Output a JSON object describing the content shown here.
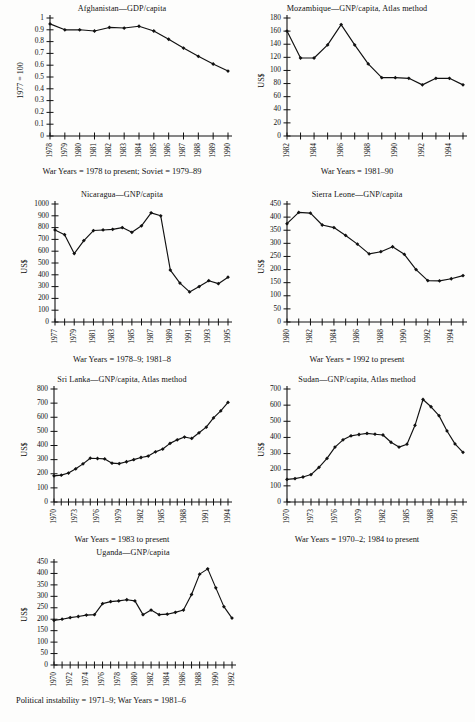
{
  "page": {
    "background_color": "#fdfdfc",
    "ink_color": "#111111",
    "footer_bleed": ""
  },
  "chart_data": [
    {
      "id": "afghanistan",
      "type": "line",
      "title": "Afghanistan—GDP/capita",
      "ylabel": "1977 = 100",
      "xlabel": "",
      "caption": "War Years = 1978 to present; Soviet = 1979–89",
      "ylim": [
        0,
        1
      ],
      "yticks": [
        "0",
        "0.1",
        "0.2",
        "0.3",
        "0.4",
        "0.5",
        "0.6",
        "0.7",
        "0.8",
        "0.9",
        "1"
      ],
      "ytickvals": [
        0,
        0.1,
        0.2,
        0.3,
        0.4,
        0.5,
        0.6,
        0.7,
        0.8,
        0.9,
        1
      ],
      "x": [
        1978,
        1979,
        1980,
        1981,
        1982,
        1983,
        1984,
        1985,
        1986,
        1987,
        1988,
        1989,
        1990
      ],
      "xtick_labels": [
        "1978",
        "1979",
        "1980",
        "1981",
        "1982",
        "1983",
        "1984",
        "1985",
        "1986",
        "1987",
        "1988",
        "1989",
        "1990"
      ],
      "values": [
        0.95,
        0.9,
        0.9,
        0.89,
        0.92,
        0.915,
        0.93,
        0.89,
        0.82,
        0.745,
        0.675,
        0.61,
        0.55
      ],
      "grid": false,
      "legend": "none"
    },
    {
      "id": "mozambique",
      "type": "line",
      "title": "Mozambique—GNP/capita, Atlas method",
      "ylabel": "US$",
      "xlabel": "",
      "caption": "War Years = 1981–90",
      "ylim": [
        0,
        180
      ],
      "yticks": [
        "0",
        "20",
        "40",
        "60",
        "80",
        "100",
        "120",
        "140",
        "160",
        "180"
      ],
      "ytickvals": [
        0,
        20,
        40,
        60,
        80,
        100,
        120,
        140,
        160,
        180
      ],
      "x": [
        1982,
        1983,
        1984,
        1985,
        1986,
        1987,
        1988,
        1989,
        1990,
        1991,
        1992,
        1993,
        1994,
        1995
      ],
      "xtick_labels": [
        "1982",
        "",
        "1984",
        "",
        "1986",
        "",
        "1988",
        "",
        "1990",
        "",
        "1992",
        "",
        "1994",
        ""
      ],
      "values": [
        160,
        119,
        119,
        139,
        170,
        139,
        110,
        89,
        89,
        88,
        78,
        88,
        88,
        78
      ],
      "grid": false,
      "legend": "none"
    },
    {
      "id": "nicaragua",
      "type": "line",
      "title": "Nicaragua—GNP/capita",
      "ylabel": "US$",
      "xlabel": "",
      "caption": "War Years = 1978–9; 1981–8",
      "ylim": [
        0,
        1000
      ],
      "yticks": [
        "0",
        "100",
        "200",
        "300",
        "400",
        "500",
        "600",
        "700",
        "800",
        "900",
        "1000"
      ],
      "ytickvals": [
        0,
        100,
        200,
        300,
        400,
        500,
        600,
        700,
        800,
        900,
        1000
      ],
      "x": [
        1977,
        1978,
        1979,
        1980,
        1981,
        1982,
        1983,
        1984,
        1985,
        1986,
        1987,
        1988,
        1989,
        1990,
        1991,
        1992,
        1993,
        1994,
        1995
      ],
      "xtick_labels": [
        "1977",
        "",
        "1979",
        "",
        "1981",
        "",
        "1983",
        "",
        "1985",
        "",
        "1987",
        "",
        "1989",
        "",
        "1991",
        "",
        "1993",
        "",
        "1995"
      ],
      "values": [
        780,
        740,
        580,
        690,
        775,
        780,
        785,
        800,
        760,
        815,
        925,
        900,
        440,
        330,
        255,
        300,
        350,
        325,
        380
      ],
      "grid": false,
      "legend": "none"
    },
    {
      "id": "sierra-leone",
      "type": "line",
      "title": "Sierra Leone—GNP/capita",
      "ylabel": "US$",
      "xlabel": "",
      "caption": "War Years = 1992 to present",
      "ylim": [
        0,
        450
      ],
      "yticks": [
        "0",
        "50",
        "100",
        "150",
        "200",
        "250",
        "300",
        "350",
        "400",
        "450"
      ],
      "ytickvals": [
        0,
        50,
        100,
        150,
        200,
        250,
        300,
        350,
        400,
        450
      ],
      "x": [
        1980,
        1981,
        1982,
        1983,
        1984,
        1985,
        1986,
        1987,
        1988,
        1989,
        1990,
        1991,
        1992,
        1993,
        1994,
        1995
      ],
      "xtick_labels": [
        "1980",
        "",
        "1982",
        "",
        "1984",
        "",
        "1986",
        "",
        "1988",
        "",
        "1990",
        "",
        "1992",
        "",
        "1994",
        ""
      ],
      "values": [
        375,
        418,
        415,
        370,
        360,
        330,
        297,
        260,
        268,
        287,
        258,
        200,
        158,
        157,
        165,
        177
      ],
      "grid": false,
      "legend": "none"
    },
    {
      "id": "sri-lanka",
      "type": "line",
      "title": "Sri Lanka—GNP/capita, Atlas method",
      "ylabel": "US$",
      "xlabel": "",
      "caption": "War Years = 1983 to present",
      "ylim": [
        0,
        800
      ],
      "yticks": [
        "0",
        "100",
        "200",
        "300",
        "400",
        "500",
        "600",
        "700",
        "800"
      ],
      "ytickvals": [
        0,
        100,
        200,
        300,
        400,
        500,
        600,
        700,
        800
      ],
      "x": [
        1970,
        1971,
        1972,
        1973,
        1974,
        1975,
        1976,
        1977,
        1978,
        1979,
        1980,
        1981,
        1982,
        1983,
        1984,
        1985,
        1986,
        1987,
        1988,
        1989,
        1990,
        1991,
        1992,
        1993,
        1994
      ],
      "xtick_labels": [
        "1970",
        "",
        "",
        "1973",
        "",
        "",
        "1976",
        "",
        "",
        "1979",
        "",
        "",
        "1982",
        "",
        "",
        "1985",
        "",
        "",
        "1988",
        "",
        "",
        "1991",
        "",
        "",
        "1994"
      ],
      "values": [
        185,
        190,
        205,
        235,
        270,
        310,
        308,
        305,
        275,
        272,
        285,
        300,
        315,
        325,
        355,
        375,
        415,
        440,
        460,
        450,
        490,
        530,
        595,
        645,
        705
      ],
      "grid": false,
      "legend": "none"
    },
    {
      "id": "sudan",
      "type": "line",
      "title": "Sudan—GNP/capita, Atlas method",
      "ylabel": "US$",
      "xlabel": "",
      "caption": "War Years = 1970–2; 1984 to present",
      "ylim": [
        0,
        700
      ],
      "yticks": [
        "0",
        "100",
        "200",
        "300",
        "400",
        "500",
        "600",
        "700"
      ],
      "ytickvals": [
        0,
        100,
        200,
        300,
        400,
        500,
        600,
        700
      ],
      "x": [
        1970,
        1971,
        1972,
        1973,
        1974,
        1975,
        1976,
        1977,
        1978,
        1979,
        1980,
        1981,
        1982,
        1983,
        1984,
        1985,
        1986,
        1987,
        1988,
        1989,
        1990,
        1991,
        1992
      ],
      "xtick_labels": [
        "1970",
        "",
        "",
        "1973",
        "",
        "",
        "1976",
        "",
        "",
        "1979",
        "",
        "",
        "1982",
        "",
        "",
        "1985",
        "",
        "",
        "1988",
        "",
        "",
        "1991",
        ""
      ],
      "values": [
        140,
        145,
        155,
        170,
        215,
        270,
        340,
        385,
        410,
        418,
        425,
        420,
        415,
        370,
        340,
        358,
        475,
        635,
        590,
        535,
        440,
        360,
        308
      ],
      "grid": false,
      "legend": "none"
    },
    {
      "id": "uganda",
      "type": "line",
      "title": "Uganda—GNP/capita",
      "ylabel": "US$",
      "xlabel": "",
      "caption": "Political instability = 1971–9; War Years = 1981–6",
      "ylim": [
        0,
        450
      ],
      "yticks": [
        "0",
        "50",
        "100",
        "150",
        "200",
        "250",
        "300",
        "350",
        "400",
        "450"
      ],
      "ytickvals": [
        0,
        50,
        100,
        150,
        200,
        250,
        300,
        350,
        400,
        450
      ],
      "x": [
        1970,
        1971,
        1972,
        1973,
        1974,
        1975,
        1976,
        1977,
        1978,
        1979,
        1980,
        1981,
        1982,
        1983,
        1984,
        1985,
        1986,
        1987,
        1988,
        1989,
        1990,
        1991,
        1992
      ],
      "xtick_labels": [
        "1970",
        "",
        "1972",
        "",
        "1974",
        "",
        "1976",
        "",
        "1978",
        "",
        "1980",
        "",
        "1982",
        "",
        "1984",
        "",
        "1986",
        "",
        "1988",
        "",
        "1990",
        "",
        "1992"
      ],
      "values": [
        195,
        200,
        207,
        212,
        218,
        220,
        268,
        277,
        280,
        285,
        280,
        220,
        240,
        220,
        222,
        230,
        240,
        308,
        397,
        420,
        337,
        255,
        205
      ],
      "grid": false,
      "legend": "none"
    }
  ]
}
